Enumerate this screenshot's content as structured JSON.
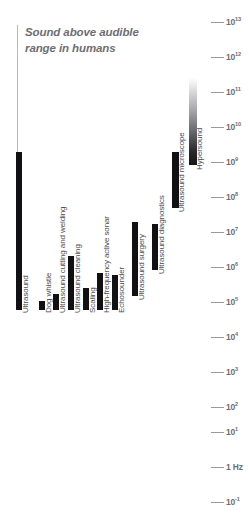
{
  "title": {
    "line1": "Sound above audible",
    "line2": "range in humans",
    "text": "Sound above audible range in humans"
  },
  "axis": {
    "unit": "Hz",
    "ticks": [
      {
        "label": "10",
        "exp": "13",
        "value": 10000000000000.0,
        "y": 22
      },
      {
        "label": "10",
        "exp": "12",
        "value": 1000000000000.0,
        "y": 57
      },
      {
        "label": "10",
        "exp": "11",
        "value": 100000000000.0,
        "y": 92
      },
      {
        "label": "10",
        "exp": "10",
        "value": 10000000000.0,
        "y": 127
      },
      {
        "label": "10",
        "exp": "9",
        "value": 1000000000.0,
        "y": 162
      },
      {
        "label": "10",
        "exp": "8",
        "value": 100000000.0,
        "y": 197
      },
      {
        "label": "10",
        "exp": "7",
        "value": 10000000.0,
        "y": 232
      },
      {
        "label": "10",
        "exp": "6",
        "value": 1000000.0,
        "y": 267
      },
      {
        "label": "10",
        "exp": "5",
        "value": 100000.0,
        "y": 302
      },
      {
        "label": "10",
        "exp": "4",
        "value": 10000.0,
        "y": 337
      },
      {
        "label": "10",
        "exp": "3",
        "value": 1000,
        "y": 372
      },
      {
        "label": "10",
        "exp": "2",
        "value": 100,
        "y": 407
      },
      {
        "label": "10",
        "exp": "1",
        "value": 10,
        "y": 432
      },
      {
        "label": "1 Hz",
        "exp": "",
        "value": 1,
        "y": 467
      },
      {
        "label": "10",
        "exp": "-1",
        "value": 0.1,
        "y": 502
      }
    ]
  },
  "chart_data": {
    "type": "bar",
    "title": "Sound above audible range in humans",
    "xlabel": "",
    "ylabel": "Frequency (Hz)",
    "scale": "log",
    "ylim": [
      0.1,
      10000000000000.0
    ],
    "grid": false,
    "legend": "none",
    "orientation": "vertical-ranges",
    "note": "Each bar spans the frequency range of the application; bars are drawn from their upper frequency down to the common baseline at 10^4 Hz.",
    "categories": [
      "Ultrasound",
      "Dog whistle",
      "Ultrasound cutting and welding",
      "Ultrasound cleaning",
      "Scaling",
      "High-frequency active sonar",
      "Echosounder",
      "Ultrasound surgery",
      "Ultrasound diagnostics",
      "Ultrasound microscope",
      "Hypersound"
    ],
    "values": [
      1000000000.0,
      20000.0,
      100000.0,
      1000000.0,
      200000.0,
      400000.0,
      600000.0,
      10000000.0,
      7000000.0,
      1000000000.0,
      100000000000.0
    ]
  },
  "bars": [
    {
      "name": "ultrasound",
      "label": "Ultrasound",
      "x": 16,
      "w": 6,
      "top": 152,
      "bottom": 310,
      "style": "solid",
      "label_x": 21,
      "label_y": 313
    },
    {
      "name": "dog-whistle",
      "label": "Dog whistle",
      "x": 39,
      "w": 6,
      "top": 301,
      "bottom": 310,
      "style": "solid",
      "label_x": 44,
      "label_y": 313
    },
    {
      "name": "ultrasound-cutting-and-welding",
      "label": "Ultrasound cutting and welding",
      "x": 53,
      "w": 6,
      "top": 294,
      "bottom": 310,
      "style": "solid",
      "label_x": 58,
      "label_y": 313
    },
    {
      "name": "ultrasound-cleaning",
      "label": "Ultrasound cleaning",
      "x": 68,
      "w": 6,
      "top": 256,
      "bottom": 310,
      "style": "solid",
      "label_x": 73,
      "label_y": 313
    },
    {
      "name": "scaling",
      "label": "Scaling",
      "x": 83,
      "w": 6,
      "top": 288,
      "bottom": 310,
      "style": "solid",
      "label_x": 88,
      "label_y": 313
    },
    {
      "name": "high-frequency-active-sonar",
      "label": "High-frequency active sonar",
      "x": 97,
      "w": 6,
      "top": 273,
      "bottom": 310,
      "style": "solid",
      "label_x": 102,
      "label_y": 313
    },
    {
      "name": "echosounder",
      "label": "Echosounder",
      "x": 112,
      "w": 6,
      "top": 275,
      "bottom": 310,
      "style": "solid",
      "label_x": 117,
      "label_y": 313
    },
    {
      "name": "ultrasound-surgery",
      "label": "Ultrasound surgery",
      "x": 132,
      "w": 6,
      "top": 222,
      "bottom": 296,
      "style": "solid",
      "label_x": 137,
      "label_y": 300
    },
    {
      "name": "ultrasound-diagnostics",
      "label": "Ultrasound diagnostics",
      "x": 152,
      "w": 6,
      "top": 224,
      "bottom": 270,
      "style": "solid",
      "label_x": 157,
      "label_y": 274
    },
    {
      "name": "ultrasound-microscope",
      "label": "Ultrasound microscope",
      "x": 172,
      "w": 7,
      "top": 152,
      "bottom": 208,
      "style": "solid",
      "label_x": 177,
      "label_y": 212
    },
    {
      "name": "hypersound",
      "label": "Hypersound",
      "x": 189,
      "w": 8,
      "top": 78,
      "bottom": 165,
      "style": "gradient",
      "label_x": 195,
      "label_y": 170
    }
  ],
  "vertical_rule": {
    "x": 17,
    "top": 25,
    "bottom": 152
  }
}
